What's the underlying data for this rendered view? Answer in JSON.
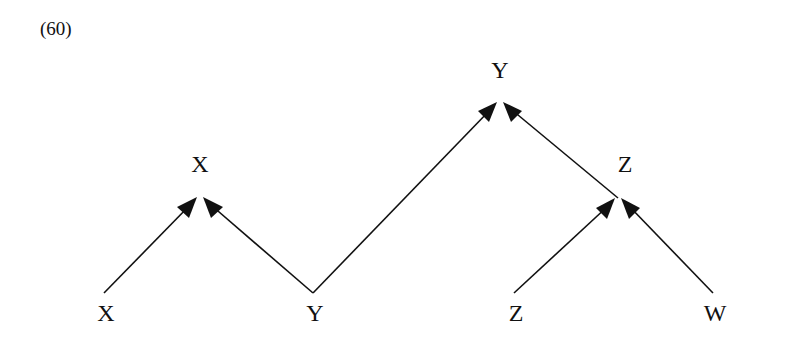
{
  "example_number": "(60)",
  "nodes": {
    "root_y": {
      "label": "Y",
      "x": 500,
      "y": 58
    },
    "mid_x": {
      "label": "X",
      "x": 200,
      "y": 152
    },
    "mid_z": {
      "label": "Z",
      "x": 625,
      "y": 152
    },
    "leaf_x": {
      "label": "X",
      "x": 106,
      "y": 301
    },
    "leaf_y": {
      "label": "Y",
      "x": 315,
      "y": 301
    },
    "leaf_z": {
      "label": "Z",
      "x": 516,
      "y": 301
    },
    "leaf_w": {
      "label": "W",
      "x": 715,
      "y": 301
    }
  },
  "edges": [
    {
      "from": "X (leaf)",
      "to": "X (mid)"
    },
    {
      "from": "Y (leaf)",
      "to": "X (mid)"
    },
    {
      "from": "Y (leaf)",
      "to": "Y (root)"
    },
    {
      "from": "Z (mid)",
      "to": "Y (root)"
    },
    {
      "from": "Z (leaf)",
      "to": "Z (mid)"
    },
    {
      "from": "W (leaf)",
      "to": "Z (mid)"
    }
  ]
}
